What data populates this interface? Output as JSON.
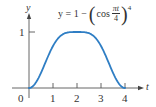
{
  "chart_data": {
    "type": "line",
    "title": "",
    "equation": {
      "lhs": "y = 1 −",
      "func": "cos",
      "frac_num": "πt",
      "frac_den": "4",
      "exponent": "4",
      "full": "y = 1 − (cos πt/4)^4"
    },
    "xlabel": "t",
    "ylabel": "y",
    "x_ticks": [
      "0",
      "1",
      "2",
      "3",
      "4"
    ],
    "y_ticks": [
      "1"
    ],
    "xlim": [
      0,
      4.7
    ],
    "ylim": [
      0,
      1.6
    ],
    "grid": false,
    "legend": null,
    "series": [
      {
        "name": "y = 1 − (cos πt/4)^4",
        "color": "#2f7ec4",
        "x": [
          0,
          0.25,
          0.5,
          0.75,
          1,
          1.25,
          1.5,
          1.75,
          2,
          2.25,
          2.5,
          2.75,
          3,
          3.25,
          3.5,
          3.75,
          4
        ],
        "y": [
          0,
          0.0747,
          0.2714,
          0.522,
          0.75,
          0.9047,
          0.9786,
          0.9986,
          1,
          0.9986,
          0.9786,
          0.9047,
          0.75,
          0.522,
          0.2714,
          0.0747,
          0
        ]
      }
    ]
  },
  "colors": {
    "curve": "#2f7ec4",
    "axis": "#555555",
    "text": "#333333"
  }
}
